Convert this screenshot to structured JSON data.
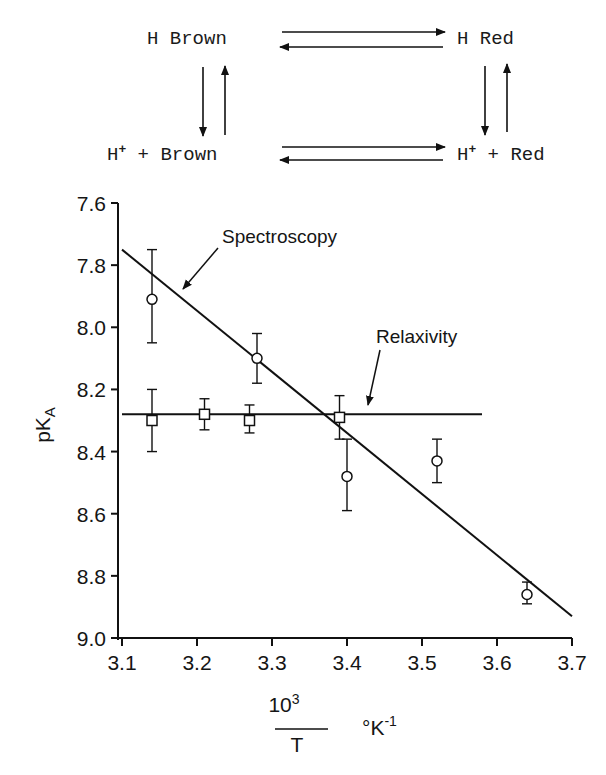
{
  "scheme": {
    "top_left": "H Brown",
    "top_right": "H Red",
    "bottom_left_prefix": "H",
    "bottom_left_sup": "+",
    "bottom_left_suffix": " + Brown",
    "bottom_right_prefix": "H",
    "bottom_right_sup": "+",
    "bottom_right_suffix": " + Red"
  },
  "chart_data": {
    "type": "scatter",
    "title": "",
    "xlabel": "10^3/T  °K^-1",
    "xlabel_numerator": "10",
    "xlabel_exp": "3",
    "xlabel_denominator": "T",
    "xlabel_unit": "°K",
    "xlabel_unit_exp": "-1",
    "ylabel": "pKA",
    "ylabel_main": "pK",
    "ylabel_sub": "A",
    "xlim": [
      3.1,
      3.7
    ],
    "ylim": [
      7.6,
      9.0
    ],
    "y_inverted": true,
    "grid": false,
    "x_ticks": [
      "3.1",
      "3.2",
      "3.3",
      "3.4",
      "3.5",
      "3.6",
      "3.7"
    ],
    "y_ticks": [
      "7.6",
      "7.8",
      "8.0",
      "8.2",
      "8.4",
      "8.6",
      "8.8",
      "9.0"
    ],
    "series": [
      {
        "name": "Spectroscopy",
        "marker": "circle",
        "points": [
          {
            "x": 3.14,
            "y": 7.91,
            "err_low": 7.75,
            "err_high": 8.05
          },
          {
            "x": 3.28,
            "y": 8.1,
            "err_low": 8.02,
            "err_high": 8.18
          },
          {
            "x": 3.4,
            "y": 8.48,
            "err_low": 8.36,
            "err_high": 8.59
          },
          {
            "x": 3.52,
            "y": 8.43,
            "err_low": 8.36,
            "err_high": 8.5
          },
          {
            "x": 3.64,
            "y": 8.86,
            "err_low": 8.82,
            "err_high": 8.89
          }
        ],
        "fit_line": {
          "x1": 3.1,
          "y1": 7.75,
          "x2": 3.7,
          "y2": 8.93
        }
      },
      {
        "name": "Relaxivity",
        "marker": "square",
        "points": [
          {
            "x": 3.14,
            "y": 8.3,
            "err_low": 8.2,
            "err_high": 8.4
          },
          {
            "x": 3.21,
            "y": 8.28,
            "err_low": 8.23,
            "err_high": 8.33
          },
          {
            "x": 3.27,
            "y": 8.3,
            "err_low": 8.25,
            "err_high": 8.34
          },
          {
            "x": 3.39,
            "y": 8.29,
            "err_low": 8.22,
            "err_high": 8.36
          }
        ],
        "fit_line": {
          "x1": 3.1,
          "y1": 8.28,
          "x2": 3.58,
          "y2": 8.28
        }
      }
    ],
    "annotations": [
      {
        "text": "Spectroscopy",
        "points_to": "Spectroscopy fit line"
      },
      {
        "text": "Relaxivity",
        "points_to": "Relaxivity fit line"
      }
    ]
  }
}
